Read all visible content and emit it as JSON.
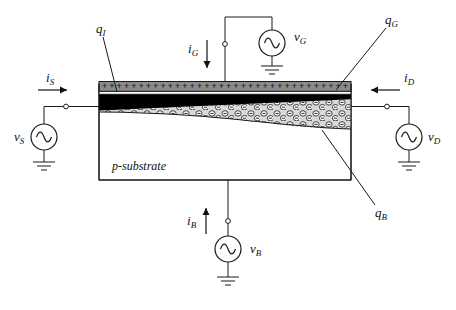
{
  "diagram": {
    "substrate_label": "p-substrate",
    "charges": {
      "q_I": {
        "symbol": "q",
        "sub": "I"
      },
      "q_G": {
        "symbol": "q",
        "sub": "G"
      },
      "q_B": {
        "symbol": "q",
        "sub": "B"
      }
    },
    "currents": {
      "i_S": {
        "symbol": "i",
        "sub": "S"
      },
      "i_G": {
        "symbol": "i",
        "sub": "G"
      },
      "i_D": {
        "symbol": "i",
        "sub": "D"
      },
      "i_B": {
        "symbol": "i",
        "sub": "B"
      }
    },
    "voltages": {
      "v_S": {
        "symbol": "v",
        "sub": "S"
      },
      "v_G": {
        "symbol": "v",
        "sub": "G"
      },
      "v_D": {
        "symbol": "v",
        "sub": "D"
      },
      "v_B": {
        "symbol": "v",
        "sub": "B"
      }
    },
    "gate_charge_row": "+ + + + + + + + + + + + + + + + + + + + + + + + + + + + + + + + + +",
    "colors": {
      "gate_fill": "#8a8a8a",
      "inversion_fill": "#000000",
      "depletion_fill": "#d9d9d9",
      "oxide_fill": "#ffffff",
      "substrate_fill": "#ffffff",
      "line": "#1a1a1a",
      "background": "#ffffff"
    },
    "sources": [
      {
        "name": "source-ac-source",
        "voltage": "v_S",
        "current": "i_S"
      },
      {
        "name": "gate-ac-source",
        "voltage": "v_G",
        "current": "i_G"
      },
      {
        "name": "drain-ac-source",
        "voltage": "v_D",
        "current": "i_D"
      },
      {
        "name": "bulk-ac-source",
        "voltage": "v_B",
        "current": "i_B"
      }
    ]
  }
}
